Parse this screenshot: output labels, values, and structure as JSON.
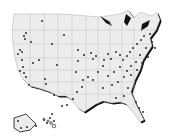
{
  "map": {
    "type": "us-locations-dot-map",
    "colors": {
      "land": "#ececec",
      "border": "#c4c4c4",
      "coast_shadow": "#111111",
      "dot": "#3a3a3a",
      "background": "#ffffff"
    },
    "dots": [
      [
        42,
        21
      ],
      [
        64,
        35
      ],
      [
        52,
        44
      ],
      [
        26,
        33
      ],
      [
        24,
        36
      ],
      [
        25,
        39
      ],
      [
        31,
        42
      ],
      [
        20,
        50
      ],
      [
        22,
        52
      ],
      [
        18,
        54
      ],
      [
        39,
        60
      ],
      [
        57,
        65
      ],
      [
        76,
        72
      ],
      [
        78,
        61
      ],
      [
        78,
        50
      ],
      [
        84,
        55
      ],
      [
        91,
        53
      ],
      [
        93,
        59
      ],
      [
        96,
        56
      ],
      [
        104,
        60
      ],
      [
        108,
        54
      ],
      [
        111,
        59
      ],
      [
        116,
        52
      ],
      [
        120,
        55
      ],
      [
        123,
        60
      ],
      [
        127,
        56
      ],
      [
        130,
        52
      ],
      [
        133,
        48
      ],
      [
        137,
        44
      ],
      [
        141,
        40
      ],
      [
        144,
        36
      ],
      [
        150,
        34
      ],
      [
        152,
        42
      ],
      [
        146,
        48
      ],
      [
        140,
        55
      ],
      [
        136,
        62
      ],
      [
        131,
        66
      ],
      [
        127,
        71
      ],
      [
        120,
        67
      ],
      [
        114,
        72
      ],
      [
        108,
        76
      ],
      [
        103,
        66
      ],
      [
        98,
        72
      ],
      [
        93,
        80
      ],
      [
        88,
        77
      ],
      [
        83,
        80
      ],
      [
        82,
        87
      ],
      [
        77,
        92
      ],
      [
        73,
        99
      ],
      [
        67,
        105
      ],
      [
        62,
        106
      ],
      [
        54,
        95
      ],
      [
        45,
        79
      ],
      [
        46,
        84
      ],
      [
        33,
        63
      ],
      [
        22,
        60
      ],
      [
        23,
        67
      ],
      [
        20,
        71
      ],
      [
        24,
        73
      ],
      [
        26,
        77
      ],
      [
        29,
        85
      ],
      [
        103,
        88
      ],
      [
        112,
        85
      ],
      [
        118,
        82
      ],
      [
        124,
        77
      ],
      [
        131,
        75
      ],
      [
        137,
        70
      ],
      [
        142,
        63
      ],
      [
        148,
        57
      ],
      [
        155,
        48
      ],
      [
        116,
        98
      ],
      [
        124,
        96
      ],
      [
        136,
        102
      ],
      [
        139,
        108
      ],
      [
        143,
        112
      ],
      [
        128,
        88
      ],
      [
        18,
        121
      ],
      [
        21,
        128
      ],
      [
        27,
        127
      ],
      [
        36,
        126
      ],
      [
        44,
        120
      ],
      [
        47,
        123
      ],
      [
        50,
        118
      ],
      [
        52,
        114
      ],
      [
        54,
        121
      ]
    ]
  }
}
